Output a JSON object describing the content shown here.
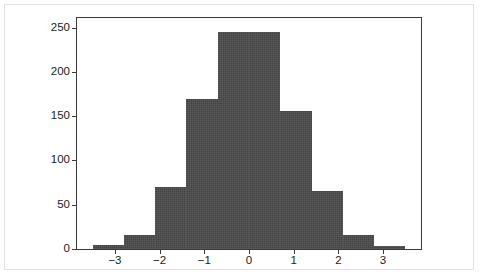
{
  "figure": {
    "background_color": "#ffffff",
    "border_color": "#e2e2e4",
    "axes_color": "#3a3a3a",
    "bar_color": "#4a4a4a",
    "title": "",
    "subtitle": ""
  },
  "chart_data": {
    "type": "bar",
    "chart_subtype": "histogram",
    "title": "",
    "subtitle": "",
    "xlabel": "",
    "ylabel": "",
    "xlim": [
      -3.85,
      3.85
    ],
    "ylim": [
      0,
      261
    ],
    "grid": false,
    "legend": null,
    "bin_width": 0.7,
    "bin_edges": [
      -3.5,
      -2.8,
      -2.1,
      -1.4,
      -0.7,
      0.0,
      0.7,
      1.4,
      2.1,
      2.8,
      3.5
    ],
    "bin_centers": [
      -3.15,
      -2.45,
      -1.75,
      -1.05,
      -0.35,
      0.35,
      1.05,
      1.75,
      2.45,
      3.15
    ],
    "values": [
      5,
      16,
      70,
      170,
      245,
      245,
      156,
      66,
      16,
      3
    ],
    "categories": [
      "-3.5 to -2.8",
      "-2.8 to -2.1",
      "-2.1 to -1.4",
      "-1.4 to -0.7",
      "-0.7 to 0.0",
      "0.0 to 0.7",
      "0.7 to 1.4",
      "1.4 to 2.1",
      "2.1 to 2.8",
      "2.8 to 3.5"
    ],
    "xticks": [
      -3,
      -2,
      -1,
      0,
      1,
      2,
      3
    ],
    "xticklabels": [
      "−3",
      "−2",
      "−1",
      "0",
      "1",
      "2",
      "3"
    ],
    "yticks": [
      0,
      50,
      100,
      150,
      200,
      250
    ],
    "yticklabels": [
      "0",
      "50",
      "100",
      "150",
      "200",
      "250"
    ],
    "total_count": 992,
    "annotations": []
  }
}
